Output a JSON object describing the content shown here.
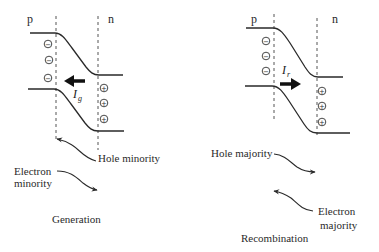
{
  "diagrams": [
    {
      "id": "generation",
      "caption": "Generation",
      "p_label": "p",
      "n_label": "n",
      "current_symbol": "I",
      "current_subscript": "g",
      "current_direction": "left",
      "negative_charge_symbol": "−",
      "positive_charge_symbol": "+",
      "labels": {
        "upper_arrow": "Hole minority",
        "lower_arrow_line1": "Electron",
        "lower_arrow_line2": "minority"
      }
    },
    {
      "id": "recombination",
      "caption": "Recombination",
      "p_label": "p",
      "n_label": "n",
      "current_symbol": "I",
      "current_subscript": "r",
      "current_direction": "right",
      "negative_charge_symbol": "−",
      "positive_charge_symbol": "+",
      "labels": {
        "upper_arrow": "Hole majority",
        "lower_arrow_line1": "Electron",
        "lower_arrow_line2": "majority"
      }
    }
  ],
  "colors": {
    "line": "#2a2a2a",
    "background": "#ffffff"
  }
}
